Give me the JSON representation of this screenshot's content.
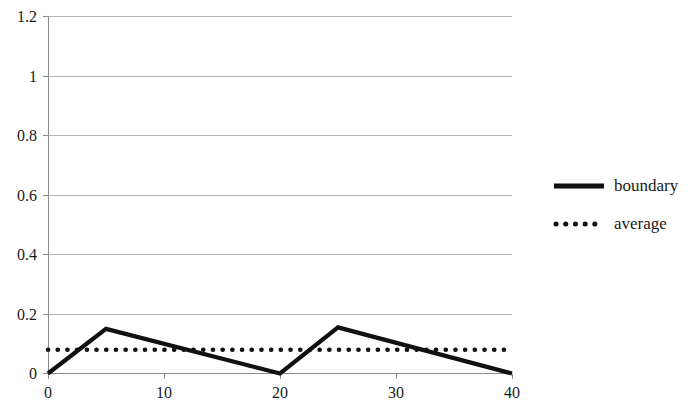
{
  "chart_data": {
    "type": "line",
    "title": "",
    "xlabel": "",
    "ylabel": "",
    "xlim": [
      0,
      40
    ],
    "ylim": [
      0,
      1.2
    ],
    "grid": true,
    "legend_position": "right",
    "x_ticks": [
      "0",
      "10",
      "20",
      "30",
      "40"
    ],
    "x_tick_values": [
      0,
      10,
      20,
      30,
      40
    ],
    "y_ticks": [
      "0",
      "0.2",
      "0.4",
      "0.6",
      "0.8",
      "1",
      "1.2"
    ],
    "y_tick_values": [
      0,
      0.2,
      0.4,
      0.6,
      0.8,
      1,
      1.2
    ],
    "series": [
      {
        "name": "boundary",
        "style": "solid",
        "color": "#111111",
        "x": [
          0,
          5,
          20,
          25,
          40
        ],
        "values": [
          0,
          0.15,
          0,
          0.155,
          0
        ]
      },
      {
        "name": "average",
        "style": "dotted",
        "color": "#111111",
        "x": [
          0,
          40
        ],
        "values": [
          0.08,
          0.08
        ]
      }
    ]
  },
  "legend": {
    "items": [
      {
        "label": "boundary",
        "marker": "solid-line-swatch"
      },
      {
        "label": "average",
        "marker": "dotted-line-swatch"
      }
    ]
  }
}
